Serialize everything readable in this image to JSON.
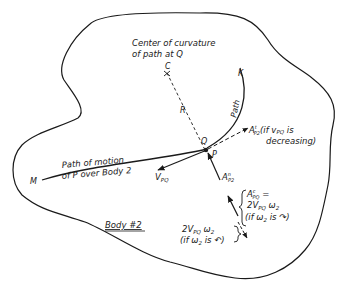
{
  "diagram": {
    "body_label": "Body #2",
    "center_label_line1": "Center of curvature",
    "center_label_line2": "of path at Q",
    "point_C": "C",
    "radius_label": "R",
    "point_K": "K",
    "path_label": "Path",
    "point_Q": "Q",
    "point_P": "P",
    "point_M": "M",
    "motion_label_line1": "Path of motion",
    "motion_label_line2": "of P over Body 2",
    "velocity_label": "V",
    "velocity_sub": "PQ",
    "tangential_label": "A",
    "tangential_sup": "t",
    "tangential_sub": "P2",
    "tangential_note_line1": "(if v",
    "tangential_note_sub": "PQ",
    "tangential_note_line1b": " is",
    "tangential_note_line2": "decreasing)",
    "normal_label": "A",
    "normal_sup": "n",
    "normal_sub": "P2",
    "coriolis_line1_A": "A",
    "coriolis_line1_sup": "c",
    "coriolis_line1_sub": "PQ",
    "coriolis_line1_eq": " =",
    "coriolis_line2": "2V",
    "coriolis_line2_sub": "PQ",
    "coriolis_line2_w": " ω",
    "coriolis_line2_wsub": "2",
    "coriolis_line3": "(if ω",
    "coriolis_line3_sub": "2",
    "coriolis_line3_end": " is ↷)",
    "coriolis_alt_line1": "2V",
    "coriolis_alt_line1_sub": "PQ",
    "coriolis_alt_line1_w": " ω",
    "coriolis_alt_line1_wsub": "2",
    "coriolis_alt_line2": "(if ω",
    "coriolis_alt_line2_sub": "2",
    "coriolis_alt_line2_end": " is ↶)"
  },
  "colors": {
    "ink": "#1a1a1a",
    "background": "#ffffff"
  }
}
